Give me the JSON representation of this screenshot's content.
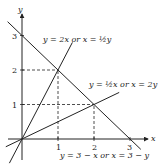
{
  "diagram": {
    "axes": {
      "x_label": "x",
      "y_label": "y",
      "x_ticks": [
        "1",
        "2",
        "3"
      ],
      "y_ticks": [
        "1",
        "2",
        "3"
      ],
      "x_range": [
        -0.5,
        3.5
      ],
      "y_range": [
        -0.5,
        3.6
      ]
    },
    "lines": [
      {
        "id": "line-2x",
        "label": "y = 2x  or  x = ½y",
        "slope": 2,
        "intercept": 0,
        "x_from": -0.35,
        "x_to": 1.4
      },
      {
        "id": "line-half-x",
        "label": "y = ½x  or  x = 2y",
        "slope": 0.5,
        "intercept": 0,
        "x_from": -0.45,
        "x_to": 2.7
      },
      {
        "id": "line-3-minus-x",
        "label": "y = 3 − x  or  x = 3 − y",
        "slope": -1,
        "intercept": 3,
        "x_from": -0.4,
        "x_to": 3.3
      }
    ],
    "intersections": [
      {
        "x": 1,
        "y": 2
      },
      {
        "x": 2,
        "y": 1
      },
      {
        "x": 0,
        "y": 0
      },
      {
        "x": 0,
        "y": 3
      },
      {
        "x": 3,
        "y": 0
      }
    ],
    "dashed_guides": [
      {
        "from": [
          0,
          2
        ],
        "to": [
          1,
          2
        ]
      },
      {
        "from": [
          1,
          0
        ],
        "to": [
          1,
          2
        ]
      },
      {
        "from": [
          0,
          1
        ],
        "to": [
          2,
          1
        ]
      },
      {
        "from": [
          2,
          0
        ],
        "to": [
          2,
          1
        ]
      }
    ]
  }
}
